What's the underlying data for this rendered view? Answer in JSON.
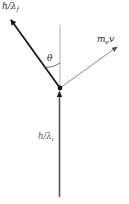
{
  "diagram": {
    "labels": {
      "scattered_photon": {
        "main": "h/λ",
        "sub": "f"
      },
      "incident_photon": {
        "main": "h/λ",
        "sub": "i"
      },
      "electron": {
        "main": "m",
        "sub": "e",
        "tail": "v"
      },
      "angle": "θ"
    },
    "geometry": {
      "collision_point": [
        60,
        88
      ],
      "reference_line_top": [
        60,
        25
      ],
      "incident_start": [
        59,
        197
      ],
      "scattered_end": [
        9,
        18
      ],
      "electron_end": [
        118,
        46
      ]
    },
    "colors": {
      "thick_vector": "#1a1a1a",
      "thin_vector": "#6a6a6a",
      "reference_line": "#9a9a9a",
      "background": "#ffffff"
    }
  }
}
